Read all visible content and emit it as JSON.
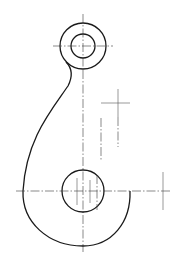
{
  "drawing": {
    "title": "",
    "type": "hook-part-technical-drawing",
    "colors": {
      "background": "#ffffff",
      "line": "#1a1a1a"
    },
    "top_eye": {
      "cx": 83,
      "cy": 46,
      "outer_r": 23,
      "inner_r": 12
    },
    "bottom_hole": {
      "cx": 83,
      "cy": 191,
      "r": 21
    },
    "hook_tip": {
      "x": 130,
      "y": 191
    },
    "side_marks": [
      {
        "type": "crosshair",
        "x": 118,
        "y": 103
      },
      {
        "type": "crosshair",
        "x": 163,
        "y": 191
      }
    ]
  }
}
